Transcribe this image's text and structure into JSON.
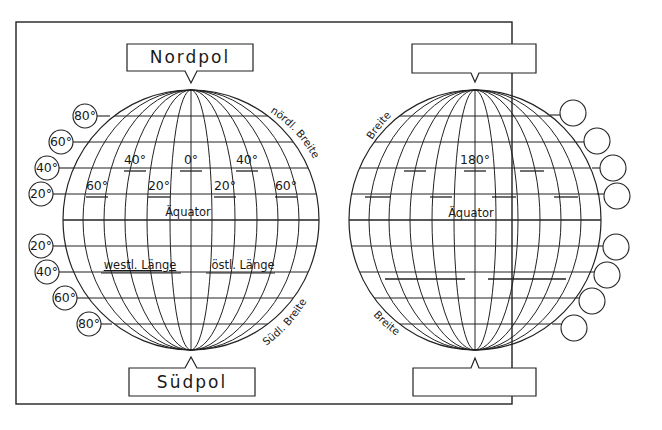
{
  "worksheet": {
    "left_globe": {
      "north_label": "Nordpol",
      "south_label": "Südpol",
      "equator_label": "Äquator",
      "north_latitude_label": "nördl. Breite",
      "south_latitude_label": "Südl. Breite",
      "west_longitude_label": "westl. Länge",
      "east_longitude_label": "östl. Länge",
      "longitude_labels": {
        "row1": [
          "40°",
          "0°",
          "40°"
        ],
        "row2": [
          "60°",
          "20°",
          "20°",
          "60°"
        ]
      },
      "latitude_circles_north": [
        "80°",
        "60°",
        "40°",
        "20°"
      ],
      "latitude_circles_south": [
        "20°",
        "40°",
        "60°",
        "80°"
      ]
    },
    "right_globe": {
      "north_label": "",
      "south_label": "",
      "equator_label": "Äquator",
      "north_latitude_label": "Breite",
      "south_latitude_label": "Breite",
      "longitude_label_center": "180°",
      "latitude_circles_north": [
        "",
        "",
        "",
        ""
      ],
      "latitude_circles_south": [
        "",
        "",
        "",
        ""
      ]
    }
  }
}
